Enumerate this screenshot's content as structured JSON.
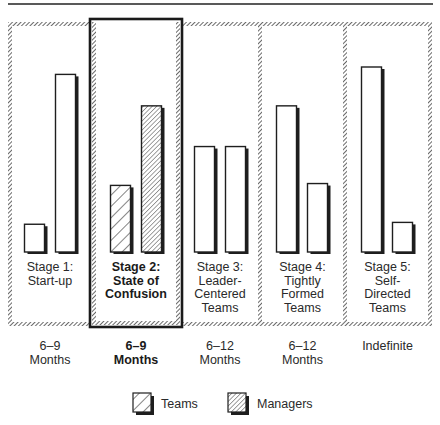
{
  "chart_data": {
    "type": "bar",
    "title": "",
    "xlabel": "",
    "ylabel": "",
    "grid": false,
    "legend_position": "bottom",
    "categories": [
      "Stage 1: Start-up",
      "Stage 2: State of Confusion",
      "Stage 3: Leader-Centered Teams",
      "Stage 4: Tightly Formed Teams",
      "Stage 5: Self-Directed Teams"
    ],
    "durations": [
      "6–9 Months",
      "6–9 Months",
      "6–12 Months",
      "6–12 Months",
      "Indefinite"
    ],
    "highlighted_category": "Stage 2: State of Confusion",
    "series": [
      {
        "name": "Teams",
        "values": [
          15,
          36,
          57,
          79,
          100
        ]
      },
      {
        "name": "Managers",
        "values": [
          96,
          79,
          57,
          37,
          16
        ]
      }
    ],
    "ylim": [
      0,
      100
    ],
    "note": "Relative bar heights (no axis shown); values scaled to tallest bar = 100"
  },
  "stages": [
    {
      "label": "Stage 1:\nStart-up",
      "duration": "6–9\nMonths",
      "highlighted": false
    },
    {
      "label": "Stage 2:\nState of\nConfusion",
      "duration": "6–9\nMonths",
      "highlighted": true
    },
    {
      "label": "Stage 3:\nLeader-\nCentered\nTeams",
      "duration": "6–12\nMonths",
      "highlighted": false
    },
    {
      "label": "Stage 4:\nTightly\nFormed\nTeams",
      "duration": "6–12\nMonths",
      "highlighted": false
    },
    {
      "label": "Stage 5:\nSelf-\nDirected\nTeams",
      "duration": "Indefinite",
      "highlighted": false
    }
  ],
  "legend": {
    "teams_label": "Teams",
    "managers_label": "Managers"
  },
  "colors": {
    "ink": "#1e1e1e",
    "frame_hatch": "#555555",
    "background": "#ffffff"
  }
}
